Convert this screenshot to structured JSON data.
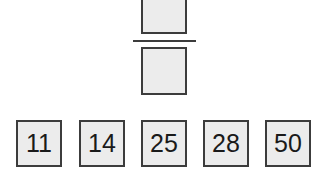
{
  "fraction": {
    "numerator_slot": "",
    "denominator_slot": ""
  },
  "number_cards": [
    "11",
    "14",
    "25",
    "28",
    "50"
  ],
  "colors": {
    "box_fill": "#ececec",
    "border": "#3c3c3c",
    "text": "#1a1a1a"
  }
}
